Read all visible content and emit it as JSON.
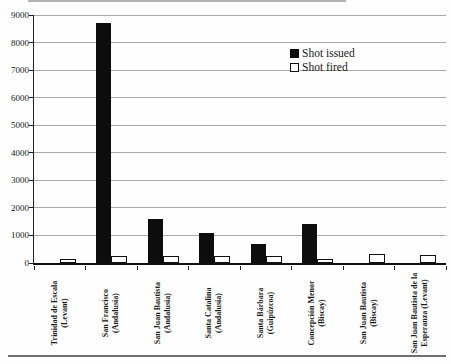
{
  "chart_data": {
    "type": "bar",
    "title": "",
    "xlabel": "",
    "ylabel": "",
    "ylim": [
      0,
      9000
    ],
    "y_tick_step": 1000,
    "grid": "horizontal",
    "legend_position": "upper center-right",
    "categories": [
      [
        "Trinidad de Escala",
        "(Levant)"
      ],
      [
        "San Francisco",
        "(Andalusia)"
      ],
      [
        "San Juan Bautista",
        "(Andalusia)"
      ],
      [
        "Santa Catalina",
        "(Andalusia)"
      ],
      [
        "Santa Bárbara",
        "(Guipúzcoa)"
      ],
      [
        "Concepción Menor",
        "(Biscay)"
      ],
      [
        "San Juan Bautista",
        "(Biscay)"
      ],
      [
        "San Juan Bautista de la",
        "Esperanza (Levant)"
      ]
    ],
    "series": [
      {
        "name": "Shot issued",
        "fill": "#0d0d0d",
        "values": [
          0,
          8700,
          1600,
          1100,
          700,
          1400,
          0,
          0
        ]
      },
      {
        "name": "Shot fired",
        "fill": "#ffffff",
        "values": [
          150,
          250,
          250,
          250,
          250,
          150,
          320,
          300
        ]
      }
    ],
    "colors": {
      "axis": "#222222",
      "gridline": "#aaaaaa",
      "text": "#1a1a1a"
    }
  }
}
